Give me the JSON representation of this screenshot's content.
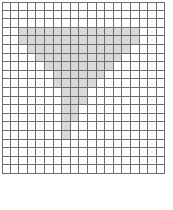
{
  "figure": {
    "kind": "cell-grid-diagram",
    "columns": 19,
    "rows": 20,
    "cell_size_px": 8.6,
    "origin_x_px": 2,
    "origin_y_px": 2,
    "colors": {
      "background": "#ffffff",
      "grid_line": "#6e6e6e",
      "cell_empty": "#ffffff",
      "cell_filled": "#d9d9d9"
    },
    "shaded_shape": {
      "name": "inverted-triangle-funnel",
      "description": "Wide shaded band at top tapering down to a narrow one-cell stem",
      "row_spans": [
        {
          "row": 3,
          "start_col": 2,
          "end_col": 15
        },
        {
          "row": 4,
          "start_col": 2,
          "end_col": 15
        },
        {
          "row": 5,
          "start_col": 3,
          "end_col": 14
        },
        {
          "row": 6,
          "start_col": 4,
          "end_col": 13
        },
        {
          "row": 7,
          "start_col": 5,
          "end_col": 12
        },
        {
          "row": 8,
          "start_col": 6,
          "end_col": 11
        },
        {
          "row": 9,
          "start_col": 6,
          "end_col": 10
        },
        {
          "row": 10,
          "start_col": 7,
          "end_col": 9
        },
        {
          "row": 11,
          "start_col": 7,
          "end_col": 9
        },
        {
          "row": 12,
          "start_col": 7,
          "end_col": 8
        },
        {
          "row": 13,
          "start_col": 7,
          "end_col": 8
        },
        {
          "row": 14,
          "start_col": 7,
          "end_col": 7
        },
        {
          "row": 15,
          "start_col": 7,
          "end_col": 7
        }
      ]
    }
  }
}
